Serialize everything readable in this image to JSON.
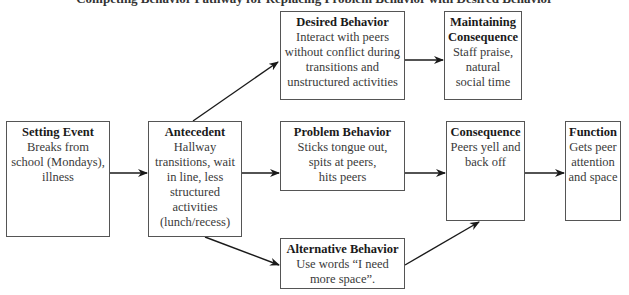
{
  "diagram": {
    "title": "Competing Behavior Pathway for Replacing Problem Behavior with Desired Behavior",
    "nodes": {
      "setting_event": {
        "heading": "Setting Event",
        "body": "Breaks from\nschool (Mondays),\nillness"
      },
      "antecedent": {
        "heading": "Antecedent",
        "body": "Hallway\ntransitions, wait\nin line, less\nstructured\nactivities\n(lunch/recess)"
      },
      "desired_behavior": {
        "heading": "Desired Behavior",
        "body": "Interact with peers\nwithout conflict during\ntransitions and\nunstructured activities"
      },
      "maintaining_consequence": {
        "heading": "Maintaining\nConsequence",
        "body": "Staff praise,\nnatural\nsocial time"
      },
      "problem_behavior": {
        "heading": "Problem Behavior",
        "body": "Sticks tongue out,\nspits at peers,\nhits peers"
      },
      "consequence": {
        "heading": "Consequence",
        "body": "Peers yell and\nback off"
      },
      "function": {
        "heading": "Function",
        "body": "Gets peer\nattention\nand space"
      },
      "alternative_behavior": {
        "heading": "Alternative Behavior",
        "body": "Use words “I need\nmore space”."
      }
    },
    "edges": [
      {
        "from": "setting_event",
        "to": "antecedent"
      },
      {
        "from": "antecedent",
        "to": "desired_behavior"
      },
      {
        "from": "antecedent",
        "to": "problem_behavior"
      },
      {
        "from": "antecedent",
        "to": "alternative_behavior"
      },
      {
        "from": "desired_behavior",
        "to": "maintaining_consequence"
      },
      {
        "from": "problem_behavior",
        "to": "consequence"
      },
      {
        "from": "alternative_behavior",
        "to": "consequence"
      },
      {
        "from": "consequence",
        "to": "function"
      }
    ],
    "colors": {
      "line": "#1a1a1a",
      "border": "#555555",
      "text": "#3a3a3a"
    }
  }
}
